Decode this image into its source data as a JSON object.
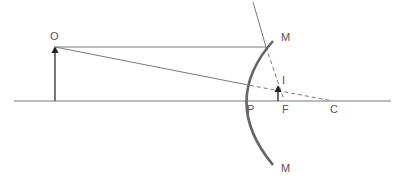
{
  "diagram": {
    "type": "convex-mirror-ray-diagram",
    "colors": {
      "line": "#7a7a7a",
      "mirror": "#666666",
      "arrow": "#333333",
      "text": "#555555"
    },
    "labels": {
      "object": "O",
      "mirror_top": "M",
      "mirror_bottom": "M",
      "image": "I",
      "pole": "P",
      "focus": "F",
      "centre": "C"
    }
  }
}
